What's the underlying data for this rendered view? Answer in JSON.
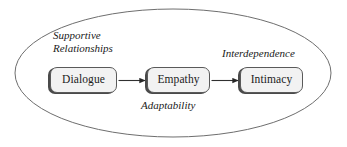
{
  "diagram": {
    "type": "flow-diagram",
    "container": {
      "shape": "ellipse",
      "name": "boundary-ellipse",
      "stroke_color": "#6e6e6e",
      "fill_color": "#ffffff",
      "stroke_width": 1,
      "cx": 173,
      "cy": 73,
      "rx": 158,
      "ry": 64
    },
    "nodes": [
      {
        "id": "dialogue",
        "label": "Dialogue",
        "x": 50,
        "y": 67,
        "width": 67,
        "height": 26,
        "fill_color": "#f2f2f2",
        "border_color": "#5a5a5a",
        "shadow_color": "#4a4a4a"
      },
      {
        "id": "empathy",
        "label": "Empathy",
        "x": 147,
        "y": 67,
        "width": 63,
        "height": 26,
        "fill_color": "#f2f2f2",
        "border_color": "#5a5a5a",
        "shadow_color": "#4a4a4a"
      },
      {
        "id": "intimacy",
        "label": "Intimacy",
        "x": 240,
        "y": 67,
        "width": 63,
        "height": 26,
        "fill_color": "#f2f2f2",
        "border_color": "#5a5a5a",
        "shadow_color": "#4a4a4a"
      }
    ],
    "connectors": [
      {
        "id": "dialogue-to-empathy",
        "from": "dialogue",
        "to": "empathy",
        "style": "solid-arrow",
        "color": "#303030",
        "label": ""
      },
      {
        "id": "empathy-to-intimacy",
        "from": "empathy",
        "to": "intimacy",
        "style": "solid-arrow",
        "color": "#303030",
        "label": ""
      }
    ],
    "annotations": [
      {
        "id": "supportive-relationships",
        "line1": "Supportive",
        "line2": "Relationships",
        "style": "italic",
        "color": "#1a1a1a",
        "position": "above-left"
      },
      {
        "id": "interdependence",
        "text": "Interdependence",
        "style": "italic",
        "color": "#1a1a1a",
        "position": "above-right"
      },
      {
        "id": "adaptability",
        "text": "Adaptability",
        "style": "italic",
        "color": "#1a1a1a",
        "position": "below-center"
      }
    ]
  }
}
